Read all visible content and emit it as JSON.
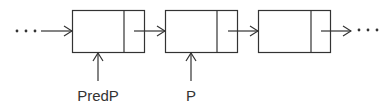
{
  "diagram": {
    "type": "linked-list",
    "stroke_color": "#333333",
    "background": "#ffffff",
    "leading_ellipsis": "...",
    "trailing_ellipsis": "...",
    "nodes": [
      {
        "id": "node-1",
        "pointer_label": "PredP"
      },
      {
        "id": "node-2",
        "pointer_label": "P"
      },
      {
        "id": "node-3",
        "pointer_label": ""
      }
    ],
    "labels": {
      "predp": "PredP",
      "p": "P"
    }
  }
}
